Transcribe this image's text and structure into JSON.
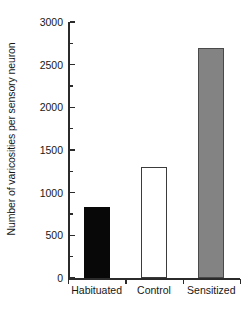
{
  "chart_data": {
    "type": "bar",
    "title": "",
    "subtitle": "",
    "xlabel": "",
    "ylabel": "Number of varicosities per sensory neuron",
    "categories": [
      "Habituated",
      "Control",
      "Sensitized"
    ],
    "values": [
      830,
      1300,
      2690
    ],
    "series": [
      {
        "name": "Number of varicosities per sensory neuron",
        "values": [
          830,
          1300,
          2690
        ]
      }
    ],
    "bar_styles": [
      {
        "category": "Habituated",
        "fill": "#080808",
        "edge": "#080808",
        "style": "solid-black"
      },
      {
        "category": "Control",
        "fill": "#ffffff",
        "edge": "#3b3b3b",
        "style": "open-white"
      },
      {
        "category": "Sensitized",
        "fill": "#838383",
        "edge": "#4a4a4a",
        "style": "solid-gray"
      }
    ],
    "ylim": [
      0,
      3000
    ],
    "xlim": [
      0,
      3
    ],
    "y_major_ticks": [
      0,
      500,
      1000,
      1500,
      2000,
      2500,
      3000
    ],
    "y_minor_ticks": [
      250,
      750,
      1250,
      1750,
      2250,
      2750
    ],
    "y_tick_labels": [
      "0",
      "500",
      "1000",
      "1500",
      "2000",
      "2500",
      "3000"
    ],
    "grid": false,
    "legend": null,
    "legend_position": "none",
    "annotations": [],
    "axis_color": "#2b2b2b",
    "text_color": "#171717",
    "background": "#ffffff"
  }
}
